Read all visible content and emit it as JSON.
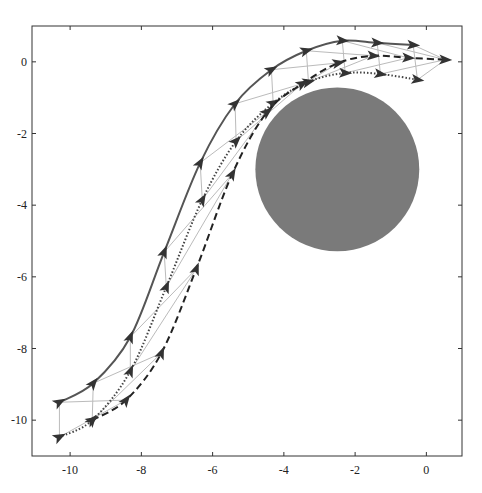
{
  "chart_data": {
    "type": "line",
    "title": "",
    "xlabel": "",
    "ylabel": "",
    "xlim": [
      -11.07,
      1.0
    ],
    "ylim": [
      -11.0,
      1.0
    ],
    "grid": false,
    "legend": null,
    "x_ticks": [
      -10,
      -8,
      -6,
      -4,
      -2,
      0
    ],
    "x_tick_labels": [
      "-10",
      "-8",
      "-6",
      "-4",
      "-2",
      "0"
    ],
    "y_ticks": [
      0,
      -2,
      -4,
      -6,
      -8,
      -10
    ],
    "y_tick_labels": [
      "0",
      "-2",
      "-4",
      "-6",
      "-8",
      "-10"
    ],
    "obstacle": {
      "shape": "circle",
      "center": [
        -2.5,
        -3.0
      ],
      "radius": 2.3,
      "color": "#7a7a7a"
    },
    "series": [
      {
        "name": "solid",
        "style": "solid",
        "color": "#555555",
        "x": [
          -10.3,
          -9.35,
          -8.31,
          -7.36,
          -6.35,
          -5.37,
          -4.35,
          -3.37,
          -2.36,
          -1.38,
          -0.37
        ],
        "y": [
          -9.5,
          -8.97,
          -7.68,
          -5.31,
          -2.82,
          -1.17,
          -0.22,
          0.31,
          0.59,
          0.53,
          0.47
        ]
      },
      {
        "name": "dotted",
        "style": "dotted",
        "color": "#444444",
        "x": [
          -10.3,
          -9.38,
          -8.31,
          -7.3,
          -6.29,
          -5.34,
          -4.3,
          -3.31,
          -2.28,
          -1.29,
          -0.25
        ],
        "y": [
          -10.47,
          -10.0,
          -8.63,
          -6.28,
          -3.85,
          -2.21,
          -1.15,
          -0.56,
          -0.31,
          -0.34,
          -0.5
        ]
      },
      {
        "name": "dashed",
        "style": "dashed",
        "color": "#222222",
        "x": [
          -9.38,
          -8.43,
          -7.44,
          -6.46,
          -5.45,
          -4.47,
          -3.48,
          -2.47,
          -1.49,
          -0.51,
          0.53
        ],
        "y": [
          -10.0,
          -9.44,
          -8.13,
          -5.78,
          -3.13,
          -1.4,
          -0.61,
          -0.03,
          0.17,
          0.11,
          0.06
        ]
      }
    ],
    "formation_links_color": "#bbbbbb"
  }
}
